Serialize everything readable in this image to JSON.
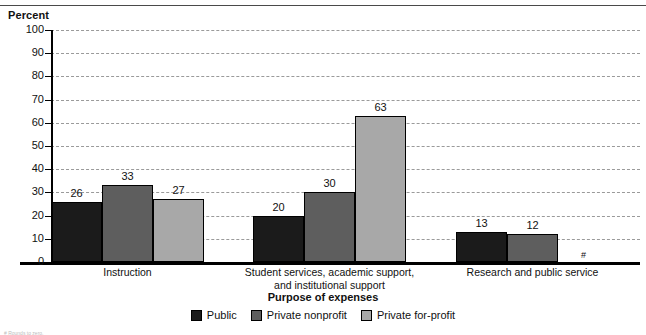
{
  "axis_title": "Percent",
  "footnote": "# Rounds to zero.",
  "legend": {
    "title": "Purpose of expenses",
    "items": [
      {
        "label": "Public",
        "key": "public",
        "color": "#1b1b1b"
      },
      {
        "label": "Private nonprofit",
        "key": "nonprofit",
        "color": "#5e5e5e"
      },
      {
        "label": "Private for-profit",
        "key": "forprofit",
        "color": "#a8a8a8"
      }
    ]
  },
  "chart_data": {
    "type": "bar",
    "title": "",
    "xlabel": "Purpose of expenses",
    "ylabel": "Percent",
    "ylim": [
      0,
      100
    ],
    "yticks": [
      0,
      10,
      20,
      30,
      40,
      50,
      60,
      70,
      80,
      90,
      100
    ],
    "ytick_labels": [
      "0",
      "10",
      "20",
      "30",
      "40",
      "50",
      "60",
      "70",
      "80",
      "90",
      "100"
    ],
    "grid": true,
    "legend_position": "bottom",
    "categories": [
      "Instruction",
      "Student services, academic support,\nand institutional support",
      "Research and public service"
    ],
    "series": [
      {
        "name": "Public",
        "color": "#1b1b1b",
        "values": [
          26,
          20,
          13
        ],
        "labels": [
          "26",
          "20",
          "13"
        ]
      },
      {
        "name": "Private nonprofit",
        "color": "#5e5e5e",
        "values": [
          33,
          30,
          12
        ],
        "labels": [
          "33",
          "30",
          "12"
        ]
      },
      {
        "name": "Private for-profit",
        "color": "#a8a8a8",
        "values": [
          27,
          63,
          0
        ],
        "labels": [
          "27",
          "63",
          "#"
        ]
      }
    ]
  }
}
